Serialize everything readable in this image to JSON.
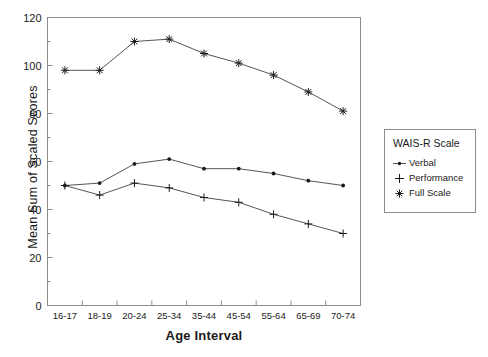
{
  "chart_data": {
    "type": "line",
    "title": "",
    "xlabel": "Age Interval",
    "ylabel": "Mean Sum of Scaled Scores",
    "categories": [
      "16-17",
      "18-19",
      "20-24",
      "25-34",
      "35-44",
      "45-54",
      "55-64",
      "65-69",
      "70-74"
    ],
    "ylim": [
      0,
      120
    ],
    "yticks": [
      0,
      20,
      40,
      60,
      80,
      100,
      120
    ],
    "yminor_step": 10,
    "grid": false,
    "legend_position": "right",
    "legend_title": "WAIS-R Scale",
    "series": [
      {
        "name": "Verbal",
        "marker": "dot",
        "values": [
          50,
          51,
          59,
          61,
          57,
          57,
          55,
          52,
          50
        ]
      },
      {
        "name": "Performance",
        "marker": "plus",
        "values": [
          50,
          46,
          51,
          49,
          45,
          43,
          38,
          34,
          30
        ]
      },
      {
        "name": "Full Scale",
        "marker": "star",
        "values": [
          98,
          98,
          110,
          111,
          105,
          101,
          96,
          89,
          81
        ]
      }
    ]
  },
  "axis": {
    "ytick_labels": [
      "0",
      "20",
      "40",
      "60",
      "80",
      "100",
      "120"
    ],
    "xtick_labels": [
      "16-17",
      "18-19",
      "20-24",
      "25-34",
      "35-44",
      "45-54",
      "55-64",
      "65-69",
      "70-74"
    ]
  },
  "legend": {
    "title": "WAIS-R Scale",
    "entries": [
      {
        "label": "Verbal",
        "icon": "dot-marker-icon"
      },
      {
        "label": "Performance",
        "icon": "plus-marker-icon"
      },
      {
        "label": "Full Scale",
        "icon": "star-marker-icon"
      }
    ]
  },
  "colors": {
    "line": "#555555",
    "marker": "#1a1a1a",
    "frame": "#8d8d8d",
    "text": "#1a1a1a",
    "background": "#ffffff"
  }
}
